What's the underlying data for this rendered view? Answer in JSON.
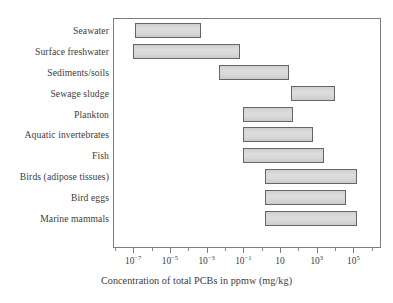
{
  "chart_data": {
    "type": "bar",
    "orientation": "horizontal",
    "subtype": "range-bar",
    "title": "",
    "xlabel": "Concentration of total PCBs in ppmw (mg/kg)",
    "ylabel": "",
    "xscale": "log",
    "xlim": [
      -8.1,
      6.5
    ],
    "grid": false,
    "legend": null,
    "xticks": [
      {
        "label_mantissa": "10",
        "label_exp": "−7",
        "value": -7
      },
      {
        "label_mantissa": "10",
        "label_exp": "−5",
        "value": -5
      },
      {
        "label_mantissa": "10",
        "label_exp": "−3",
        "value": -3
      },
      {
        "label_mantissa": "10",
        "label_exp": "−1",
        "value": -1
      },
      {
        "label_mantissa": "10",
        "label_exp": "",
        "value": 1
      },
      {
        "label_mantissa": "10",
        "label_exp": "3",
        "value": 3
      },
      {
        "label_mantissa": "10",
        "label_exp": "5",
        "value": 5
      }
    ],
    "minor_ticks": [
      -8,
      -6,
      -4,
      -2,
      0,
      2,
      4,
      6
    ],
    "categories": [
      "Seawater",
      "Surface freshwater",
      "Sediments/soils",
      "Sewage sludge",
      "Plankton",
      "Aquatic invertebrates",
      "Fish",
      "Birds (adipose tissues)",
      "Bird eggs",
      "Marine mammals"
    ],
    "ranges": [
      {
        "category": "Seawater",
        "low_log10": -6.9,
        "high_log10": -3.3
      },
      {
        "category": "Surface freshwater",
        "low_log10": -7.0,
        "high_log10": -1.2
      },
      {
        "category": "Sediments/soils",
        "low_log10": -2.3,
        "high_log10": 1.5
      },
      {
        "category": "Sewage sludge",
        "low_log10": 1.6,
        "high_log10": 4.0
      },
      {
        "category": "Plankton",
        "low_log10": -1.0,
        "high_log10": 1.7
      },
      {
        "category": "Aquatic invertebrates",
        "low_log10": -1.0,
        "high_log10": 2.8
      },
      {
        "category": "Fish",
        "low_log10": -1.0,
        "high_log10": 3.4
      },
      {
        "category": "Birds (adipose tissues)",
        "low_log10": 0.2,
        "high_log10": 5.2
      },
      {
        "category": "Bird eggs",
        "low_log10": 0.2,
        "high_log10": 4.6
      },
      {
        "category": "Marine mammals",
        "low_log10": 0.2,
        "high_log10": 5.2
      }
    ],
    "colors": {
      "bar_fill": "#d5d5d5",
      "bar_stroke": "#666666",
      "frame": "#7d7d7d",
      "text": "#3c3c3c",
      "background": "#ffffff"
    }
  }
}
